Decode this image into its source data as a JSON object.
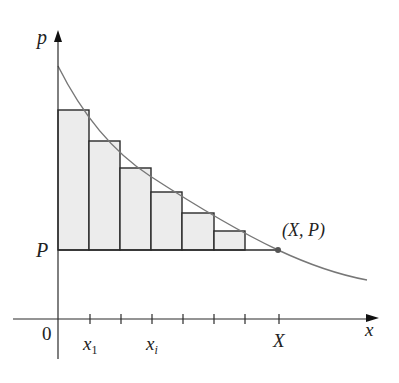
{
  "diagram": {
    "type": "left-endpoint rectangles under decreasing curve (consumer surplus)",
    "axes": {
      "y_label": "p",
      "x_label": "x",
      "origin_label": "0"
    },
    "labels": {
      "price_level": "P",
      "point": "(X, P)",
      "x_ticks": {
        "first": "x",
        "first_sub": "1",
        "ith": "x",
        "ith_sub": "i",
        "end": "X"
      }
    },
    "rectangles": [
      {
        "x0": 58,
        "x1": 89,
        "top": 110
      },
      {
        "x0": 89,
        "x1": 120,
        "top": 141
      },
      {
        "x0": 120,
        "x1": 151,
        "top": 168
      },
      {
        "x0": 151,
        "x1": 182,
        "top": 192
      },
      {
        "x0": 182,
        "x1": 214,
        "top": 213
      },
      {
        "x0": 214,
        "x1": 245,
        "top": 231
      }
    ],
    "colors": {
      "fill": "#eeeeee",
      "stroke": "#222222",
      "curve": "#777777"
    }
  }
}
